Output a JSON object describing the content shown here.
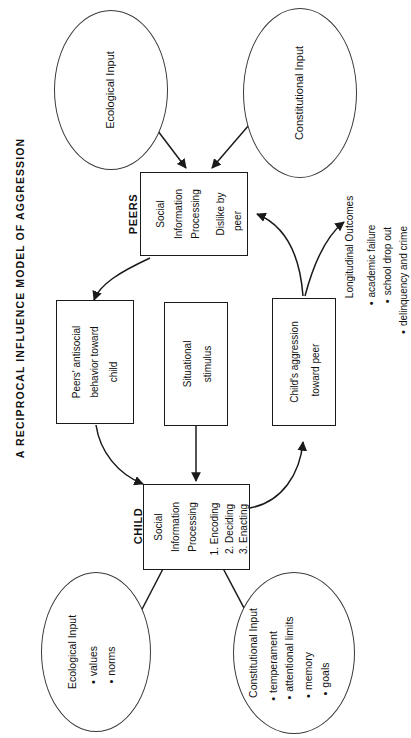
{
  "figure": {
    "title": "A RECIPROCAL INFLUENCE MODEL OF AGGRESSION",
    "orientation": "rotated-90-ccw",
    "line_color": "#1a1a1a",
    "background": "#ffffff"
  },
  "groups": {
    "peers_label": "PEERS",
    "child_label": "CHILD"
  },
  "nodes": {
    "ecological_input_top": {
      "label": "Ecological Input",
      "shape": "ellipse"
    },
    "constitutional_input_top": {
      "label": "Constitutional Input",
      "shape": "ellipse"
    },
    "peers_sip": {
      "line1": "Social",
      "line2": "Information",
      "line3": "Processing",
      "line4": "Dislike by",
      "line5": "peer",
      "shape": "rectangle"
    },
    "peers_antisocial": {
      "line1": "Peers' antisocial",
      "line2": "behavior toward",
      "line3": "child",
      "shape": "rectangle"
    },
    "situational_stimulus": {
      "line1": "Situational",
      "line2": "stimulus",
      "shape": "rectangle"
    },
    "child_aggression": {
      "line1": "Child's aggression",
      "line2": "toward peer",
      "shape": "rectangle"
    },
    "child_sip": {
      "line1": "Social",
      "line2": "Information",
      "line3": "Processing",
      "step1": "1. Encoding",
      "step2": "2. Deciding",
      "step3": "3. Enacting",
      "shape": "rectangle"
    },
    "longitudinal_outcomes": {
      "heading": "Longitudinal Outcomes",
      "items": [
        "academic failure",
        "school drop out",
        "delinquency and crime"
      ]
    },
    "ecological_input_bottom": {
      "heading": "Ecological Input",
      "items": [
        "values",
        "norms"
      ],
      "shape": "ellipse"
    },
    "constitutional_input_bottom": {
      "heading": "Constitutional Input",
      "items": [
        "temperament",
        "attentional limits",
        "memory",
        "goals"
      ],
      "shape": "ellipse"
    }
  },
  "edges": [
    {
      "from": "ecological_input_top",
      "to": "peers_sip",
      "style": "straight-arrow"
    },
    {
      "from": "constitutional_input_top",
      "to": "peers_sip",
      "style": "straight-arrow"
    },
    {
      "from": "peers_sip",
      "to": "peers_antisocial",
      "style": "curved-arrow"
    },
    {
      "from": "peers_antisocial",
      "to": "child_sip",
      "style": "curved-arrow"
    },
    {
      "from": "situational_stimulus",
      "to": "child_sip",
      "style": "straight-arrow"
    },
    {
      "from": "child_sip",
      "to": "child_aggression",
      "style": "curved-arrow"
    },
    {
      "from": "child_aggression",
      "to": "peers_sip",
      "style": "curved-arrow"
    },
    {
      "from": "child_aggression",
      "to": "longitudinal_outcomes",
      "style": "curved-arrow"
    },
    {
      "from": "ecological_input_bottom",
      "to": "child_sip",
      "style": "straight-arrow"
    },
    {
      "from": "constitutional_input_bottom",
      "to": "child_sip",
      "style": "straight-arrow"
    }
  ]
}
